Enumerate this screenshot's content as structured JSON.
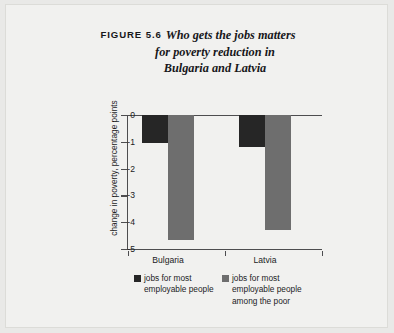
{
  "figure": {
    "label": "FIGURE 5.6",
    "title_line1": "Who gets the jobs matters",
    "title_line2": "for poverty reduction in",
    "title_line3": "Bulgaria and Latvia"
  },
  "colors": {
    "series_1": "#262626",
    "series_2": "#6e6e6e",
    "axis": "#4d4d4f",
    "page_background": "#e9e9e7",
    "plot_background": "#f1f1ef"
  },
  "legend": {
    "items": [
      {
        "label": "jobs for most employable people",
        "swatch": "#262626"
      },
      {
        "label": "jobs for most employable people among the poor",
        "swatch": "#6e6e6e"
      }
    ]
  },
  "axis": {
    "y_label": "change in poverty, percentage points",
    "y_ticks": [
      "0",
      "-1",
      "-2",
      "-3",
      "-4",
      "-5"
    ]
  },
  "chart_data": {
    "type": "bar",
    "title": "Who gets the jobs matters for poverty reduction in Bulgaria and Latvia",
    "xlabel": "",
    "ylabel": "change in poverty, percentage points",
    "ylim": [
      -5,
      0
    ],
    "yticks": [
      0,
      -1,
      -2,
      -3,
      -4,
      -5
    ],
    "grid": false,
    "legend_position": "bottom",
    "categories": [
      "Bulgaria",
      "Latvia"
    ],
    "series": [
      {
        "name": "jobs for most employable people",
        "values": [
          -1.05,
          -1.2
        ],
        "color": "#262626"
      },
      {
        "name": "jobs for most employable people among the poor",
        "values": [
          -4.65,
          -4.3
        ],
        "color": "#6e6e6e"
      }
    ]
  }
}
